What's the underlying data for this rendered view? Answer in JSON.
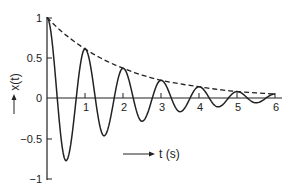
{
  "chart_data": {
    "type": "line",
    "title": "",
    "xlabel": "t (s)",
    "ylabel": "x(t)",
    "xlim": [
      0,
      6
    ],
    "ylim": [
      -1,
      1
    ],
    "x_ticks": [
      "1",
      "2",
      "3",
      "4",
      "5",
      "6"
    ],
    "y_ticks": [
      "1",
      "0.5",
      "0",
      "-0.5",
      "-1"
    ],
    "grid": false,
    "legend": null,
    "series": [
      {
        "name": "x(t) damped oscillation",
        "style": "solid",
        "x": [
          0,
          0.5,
          1,
          1.5,
          2,
          2.5,
          3,
          3.5,
          4,
          4.5,
          5,
          5.5,
          6
        ],
        "values": [
          1,
          -0.78,
          0.61,
          -0.47,
          0.37,
          -0.29,
          0.22,
          -0.17,
          0.14,
          -0.11,
          0.08,
          -0.06,
          0.05
        ]
      },
      {
        "name": "envelope",
        "style": "dashed",
        "x": [
          0,
          1,
          2,
          3,
          4,
          5,
          6
        ],
        "values": [
          1,
          0.61,
          0.37,
          0.22,
          0.14,
          0.08,
          0.05
        ]
      }
    ]
  },
  "labels": {
    "x_axis": "t (s)",
    "y_axis": "x(t)",
    "ticks_x": [
      "1",
      "2",
      "3",
      "4",
      "5",
      "6"
    ],
    "ticks_y": [
      "1",
      "0.5",
      "0",
      "−0.5",
      "−1"
    ]
  }
}
